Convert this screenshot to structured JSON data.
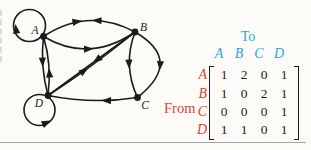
{
  "figure": {
    "type": "digraph-with-adjacency-matrix",
    "ink_color": "#1b1b1b",
    "blue_accent": "#2fa5d9",
    "red_accent": "#df4338",
    "background": "#fcfbf8"
  },
  "graph": {
    "nodes": [
      {
        "id": "a",
        "label": "A"
      },
      {
        "id": "b",
        "label": "B"
      },
      {
        "id": "c",
        "label": "C"
      },
      {
        "id": "d",
        "label": "D"
      }
    ],
    "edges": [
      {
        "from": "A",
        "to": "A",
        "count": 1
      },
      {
        "from": "A",
        "to": "B",
        "count": 2
      },
      {
        "from": "A",
        "to": "D",
        "count": 1
      },
      {
        "from": "B",
        "to": "A",
        "count": 1
      },
      {
        "from": "B",
        "to": "C",
        "count": 2
      },
      {
        "from": "B",
        "to": "D",
        "count": 1
      },
      {
        "from": "C",
        "to": "D",
        "count": 1
      },
      {
        "from": "D",
        "to": "A",
        "count": 1
      },
      {
        "from": "D",
        "to": "B",
        "count": 1
      },
      {
        "from": "D",
        "to": "D",
        "count": 1
      }
    ]
  },
  "matrix": {
    "to_label": "To",
    "from_label": "From",
    "col_headers": [
      "A",
      "B",
      "C",
      "D"
    ],
    "rows": [
      {
        "header": "A",
        "values": [
          "1",
          "2",
          "0",
          "1"
        ]
      },
      {
        "header": "B",
        "values": [
          "1",
          "0",
          "2",
          "1"
        ]
      },
      {
        "header": "C",
        "values": [
          "0",
          "0",
          "0",
          "1"
        ]
      },
      {
        "header": "D",
        "values": [
          "1",
          "1",
          "0",
          "1"
        ]
      }
    ]
  }
}
